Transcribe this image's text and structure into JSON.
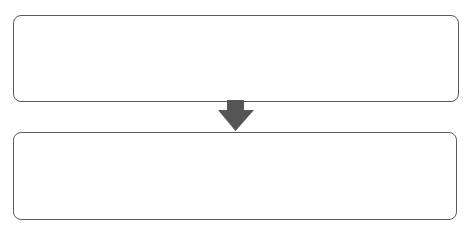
{
  "diagram": {
    "type": "flow",
    "direction": "top-to-bottom",
    "nodes": [
      {
        "id": "step-1",
        "label": ""
      },
      {
        "id": "step-2",
        "label": ""
      }
    ],
    "edges": [
      {
        "from": "step-1",
        "to": "step-2",
        "icon": "arrow-down-icon"
      }
    ],
    "colors": {
      "border": "#5a5a5a",
      "arrow": "#555555",
      "background": "#ffffff"
    }
  }
}
